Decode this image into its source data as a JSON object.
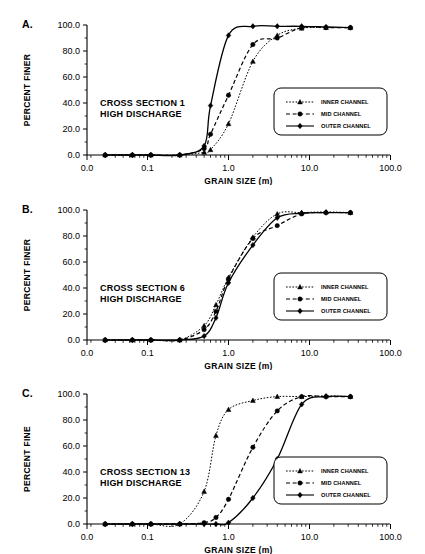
{
  "figure": {
    "panel_labels": [
      "A.",
      "B.",
      "C."
    ],
    "axis": {
      "x_title": "GRAIN SIZE (m)",
      "x_ticklabels": [
        "0.0",
        "0.1",
        "1.0",
        "10.0",
        "100.0"
      ],
      "x_tickvalues": [
        0.0,
        0.1,
        1.0,
        10.0,
        100.0
      ],
      "y_ticklabels": [
        "0.0",
        "20.0",
        "40.0",
        "60.0",
        "80.0",
        "100.0"
      ],
      "y_tickvalues": [
        0,
        20,
        40,
        60,
        80,
        100
      ]
    },
    "legend": {
      "entries": [
        {
          "label": "INNER CHANNEL",
          "marker": "triangle-icon",
          "line": "dotted"
        },
        {
          "label": "MID CHANNEL",
          "marker": "circle-icon",
          "line": "dashed"
        },
        {
          "label": "OUTER CHANNEL",
          "marker": "diamond-icon",
          "line": "solid"
        }
      ]
    }
  },
  "chart_data": [
    {
      "type": "line",
      "panel": "A.",
      "title": "CROSS SECTION 1",
      "subtitle": "HIGH DISCHARGE",
      "xlabel": "GRAIN SIZE (m)",
      "ylabel": "PERCENT FINER",
      "xscale": "log",
      "xlim": [
        0.02,
        100.0
      ],
      "ylim": [
        0,
        100
      ],
      "grid": false,
      "legend_position": "right",
      "series": [
        {
          "name": "INNER CHANNEL",
          "marker": "triangle",
          "line": "dotted",
          "x": [
            0.03,
            0.065,
            0.11,
            0.25,
            0.5,
            0.6,
            1.0,
            2.0,
            4.0,
            8.0,
            16.0,
            32.0
          ],
          "y": [
            0.0,
            0.0,
            0.0,
            0.0,
            2.0,
            4.0,
            24.0,
            72.0,
            92.0,
            97.5,
            98.0,
            98.0
          ]
        },
        {
          "name": "MID CHANNEL",
          "marker": "circle",
          "line": "dashed",
          "x": [
            0.03,
            0.065,
            0.11,
            0.25,
            0.5,
            0.6,
            1.0,
            2.0,
            4.0,
            8.0,
            16.0,
            32.0
          ],
          "y": [
            0.0,
            0.0,
            0.0,
            0.0,
            5.0,
            16.0,
            46.0,
            85.0,
            90.0,
            98.0,
            98.0,
            98.0
          ]
        },
        {
          "name": "OUTER CHANNEL",
          "marker": "diamond",
          "line": "solid",
          "x": [
            0.03,
            0.065,
            0.11,
            0.25,
            0.5,
            0.6,
            1.0,
            2.0,
            4.0,
            8.0,
            16.0,
            32.0
          ],
          "y": [
            0.0,
            0.0,
            0.0,
            0.0,
            7.0,
            38.0,
            92.0,
            99.0,
            99.0,
            99.0,
            98.5,
            98.0
          ]
        }
      ]
    },
    {
      "type": "line",
      "panel": "B.",
      "title": "CROSS SECTION 6",
      "subtitle": "HIGH DISCHARGE",
      "xlabel": "GRAIN SIZE (m)",
      "ylabel": "PERCENT FINER",
      "xscale": "log",
      "xlim": [
        0.02,
        100.0
      ],
      "ylim": [
        0,
        100
      ],
      "grid": false,
      "legend_position": "right",
      "series": [
        {
          "name": "INNER CHANNEL",
          "marker": "triangle",
          "line": "dotted",
          "x": [
            0.03,
            0.065,
            0.11,
            0.25,
            0.5,
            0.7,
            1.0,
            2.0,
            4.0,
            8.0,
            16.0,
            32.0
          ],
          "y": [
            0.0,
            0.0,
            0.0,
            0.0,
            11.0,
            27.0,
            48.0,
            79.0,
            97.0,
            98.0,
            98.5,
            98.0
          ]
        },
        {
          "name": "MID CHANNEL",
          "marker": "circle",
          "line": "dashed",
          "x": [
            0.03,
            0.065,
            0.11,
            0.25,
            0.5,
            0.7,
            1.0,
            2.0,
            4.0,
            8.0,
            16.0,
            32.0
          ],
          "y": [
            0.0,
            0.0,
            0.0,
            0.0,
            8.0,
            22.0,
            47.0,
            78.0,
            88.0,
            97.0,
            98.0,
            98.0
          ]
        },
        {
          "name": "OUTER CHANNEL",
          "marker": "diamond",
          "line": "solid",
          "x": [
            0.03,
            0.065,
            0.11,
            0.25,
            0.5,
            0.7,
            1.0,
            2.0,
            4.0,
            8.0,
            16.0,
            32.0
          ],
          "y": [
            0.0,
            0.0,
            0.0,
            0.0,
            3.0,
            17.0,
            44.0,
            73.0,
            94.0,
            97.5,
            98.0,
            98.0
          ]
        }
      ]
    },
    {
      "type": "line",
      "panel": "C.",
      "title": "CROSS SECTION 13",
      "subtitle": "HIGH DISCHARGE",
      "xlabel": "GRAIN SIZE (m)",
      "ylabel": "PERCENT FINE",
      "xscale": "log",
      "xlim": [
        0.02,
        100.0
      ],
      "ylim": [
        0,
        100
      ],
      "grid": false,
      "legend_position": "right",
      "series": [
        {
          "name": "INNER CHANNEL",
          "marker": "triangle",
          "line": "dotted",
          "x": [
            0.03,
            0.065,
            0.11,
            0.25,
            0.5,
            0.7,
            1.0,
            2.0,
            4.0,
            8.0,
            16.0,
            32.0
          ],
          "y": [
            0.0,
            0.0,
            0.0,
            0.0,
            25.0,
            68.0,
            88.0,
            95.0,
            98.0,
            98.0,
            98.5,
            98.0
          ]
        },
        {
          "name": "MID CHANNEL",
          "marker": "circle",
          "line": "dashed",
          "x": [
            0.03,
            0.065,
            0.11,
            0.25,
            0.5,
            0.7,
            1.0,
            2.0,
            4.0,
            8.0,
            16.0,
            32.0
          ],
          "y": [
            0.0,
            0.0,
            0.0,
            0.0,
            1.0,
            5.0,
            19.0,
            59.0,
            87.0,
            98.0,
            98.0,
            98.0
          ]
        },
        {
          "name": "OUTER CHANNEL",
          "marker": "diamond",
          "line": "solid",
          "x": [
            0.03,
            0.065,
            0.11,
            0.25,
            0.5,
            0.7,
            1.0,
            2.0,
            4.0,
            8.0,
            16.0,
            32.0
          ],
          "y": [
            0.0,
            0.0,
            0.0,
            0.0,
            0.0,
            0.0,
            1.0,
            20.0,
            50.0,
            92.0,
            98.0,
            98.0
          ]
        }
      ]
    }
  ]
}
